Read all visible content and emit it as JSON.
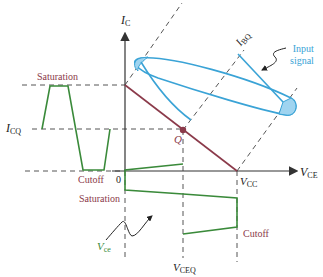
{
  "diagram": {
    "axes": {
      "y_label": "I",
      "y_label_sub": "C",
      "x_label": "V",
      "x_label_sub": "CE",
      "origin_label": "0"
    },
    "labels": {
      "saturation_left": "Saturation",
      "cutoff_left": "Cutoff",
      "icq": "I",
      "icq_sub": "CQ",
      "ibq": "I",
      "ibq_sub": "BQ",
      "q_point": "Q",
      "vcc": "V",
      "vcc_sub": "CC",
      "input_signal_line1": "Input",
      "input_signal_line2": "signal",
      "saturation_bottom": "Saturation",
      "cutoff_bottom": "Cutoff",
      "vce": "V",
      "vce_sub": "ce",
      "vceq": "V",
      "vceq_sub": "CEQ"
    },
    "colors": {
      "axis": "#333333",
      "load_line": "#8b3a4a",
      "input_signal": "#3aa3d6",
      "input_fill": "#9fd4f0",
      "output_waveform": "#3a8a3a",
      "dashed": "#555555",
      "text_maroon": "#8b3a4a"
    }
  }
}
